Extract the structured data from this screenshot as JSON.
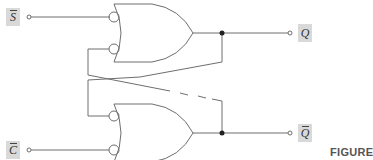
{
  "diagram": {
    "type": "SR latch from NAND-equivalent OR gates with inverted inputs",
    "inputs": [
      {
        "label": "S",
        "overbar": true
      },
      {
        "label": "C",
        "overbar": true
      }
    ],
    "outputs": [
      {
        "label": "Q",
        "overbar": false
      },
      {
        "label": "Q",
        "overbar": true
      }
    ],
    "gates": [
      {
        "id": "upper-gate",
        "kind": "OR",
        "inverted_inputs": 2
      },
      {
        "id": "lower-gate",
        "kind": "OR",
        "inverted_inputs": 2
      }
    ],
    "caption": "FIGURE",
    "colors": {
      "line": "#6e6e6e",
      "label_bg": "#d9d9d9",
      "junction": "#222222"
    }
  }
}
